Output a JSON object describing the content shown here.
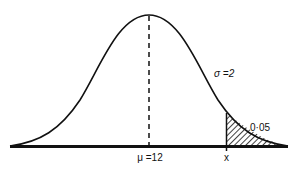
{
  "diagram": {
    "type": "normal-distribution",
    "labels": {
      "mean": "μ =12",
      "cutoff": "x",
      "sigma": "σ =2",
      "tail_area": "0·05"
    },
    "parameters": {
      "mean": 12,
      "sigma": 2,
      "tail_probability": 0.05
    },
    "colors": {
      "curve": "#111111",
      "background": "#ffffff",
      "hatch": "#111111"
    }
  }
}
